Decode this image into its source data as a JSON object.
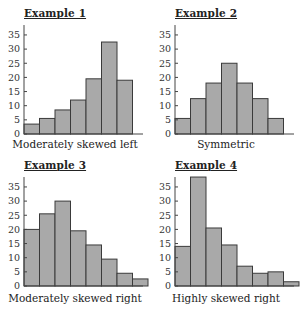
{
  "chart_data": [
    {
      "type": "bar",
      "title": "Example 1",
      "caption": "Moderately skewed left",
      "categories": [
        "1",
        "2",
        "3",
        "4",
        "5",
        "6",
        "7"
      ],
      "values": [
        3.5,
        5.5,
        8.5,
        12,
        19.5,
        32.5,
        19
      ],
      "yticks": [
        0,
        5,
        10,
        15,
        20,
        25,
        30,
        35
      ],
      "ylim": [
        0,
        38
      ],
      "xlabel": "",
      "ylabel": "",
      "grid": false
    },
    {
      "type": "bar",
      "title": "Example 2",
      "caption": "Symmetric",
      "categories": [
        "1",
        "2",
        "3",
        "4",
        "5",
        "6",
        "7"
      ],
      "values": [
        5.5,
        12.5,
        18,
        25,
        18,
        12.5,
        5.5
      ],
      "yticks": [
        0,
        5,
        10,
        15,
        20,
        25,
        30,
        35
      ],
      "ylim": [
        0,
        38
      ],
      "xlabel": "",
      "ylabel": "",
      "grid": false
    },
    {
      "type": "bar",
      "title": "Example 3",
      "caption": "Moderately skewed right",
      "categories": [
        "1",
        "2",
        "3",
        "4",
        "5",
        "6",
        "7",
        "8"
      ],
      "values": [
        20,
        25.5,
        30,
        19.5,
        14.5,
        9.5,
        4.5,
        2.5
      ],
      "yticks": [
        0,
        5,
        10,
        15,
        20,
        25,
        30,
        35
      ],
      "ylim": [
        0,
        40
      ],
      "xlabel": "",
      "ylabel": "",
      "grid": false
    },
    {
      "type": "bar",
      "title": "Example 4",
      "caption": "Highly skewed right",
      "categories": [
        "1",
        "2",
        "3",
        "4",
        "5",
        "6",
        "7",
        "8"
      ],
      "values": [
        14,
        38.5,
        20.5,
        14.5,
        7,
        4.5,
        5,
        1.5
      ],
      "yticks": [
        0,
        5,
        10,
        15,
        20,
        25,
        30,
        35
      ],
      "ylim": [
        0,
        40
      ],
      "xlabel": "",
      "ylabel": "",
      "grid": false
    }
  ],
  "colors": {
    "bar_fill": "#a9a9a9",
    "bar_stroke": "#3a3a3a",
    "axis": "#444444"
  }
}
